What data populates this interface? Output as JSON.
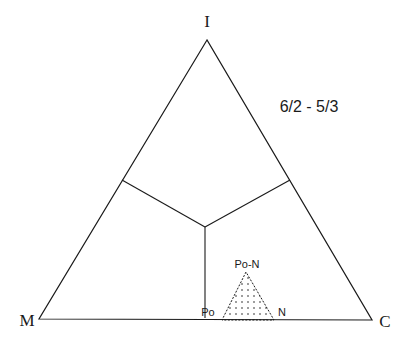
{
  "diagram": {
    "type": "ternary-diagram",
    "vertices": {
      "top": {
        "label": "I",
        "x": 207,
        "y": 40
      },
      "left": {
        "label": "M",
        "x": 39,
        "y": 319
      },
      "right": {
        "label": "C",
        "x": 372,
        "y": 320
      }
    },
    "ratio_label": "6/2 - 5/3",
    "boundaries": {
      "left_junction": {
        "x": 122,
        "y": 180
      },
      "right_junction": {
        "x": 290,
        "y": 180
      },
      "center": {
        "x": 205,
        "y": 227
      },
      "bottom_end": {
        "x": 205,
        "y": 318
      }
    },
    "stability_field": {
      "apex_label": "Po-N",
      "left_label": "Po",
      "right_label": "N",
      "fill": "dotted",
      "apex": {
        "x": 246,
        "y": 272
      },
      "left": {
        "x": 222,
        "y": 320
      },
      "right": {
        "x": 274,
        "y": 320
      }
    },
    "colors": {
      "line": "#1a1a1a",
      "background": "#ffffff"
    }
  }
}
